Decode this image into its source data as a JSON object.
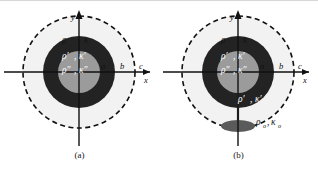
{
  "figure": {
    "type": "two-panel-schematic",
    "colors": {
      "background": "#ffffff",
      "outer_medium": "#ffffff",
      "mid_ring": "#eeeeee",
      "dark_shell": "#232323",
      "inner_core": "#9b9b9b",
      "ellipse": "#5a5a5a",
      "axis": "#111111",
      "dashed": "#111111",
      "top_rule": "#d8d8d8"
    },
    "panels": [
      {
        "id": "a",
        "caption": "(a)",
        "axes": {
          "x_label": "x",
          "y_label": "y"
        },
        "tick_labels": [
          "a",
          "b",
          "c"
        ],
        "regions": [
          {
            "name": "core",
            "label_rho": "ρ″",
            "label_kappa": "κ″",
            "fill": "#9b9b9b",
            "radius_label": "a"
          },
          {
            "name": "shell",
            "label_rho": "ρ′",
            "label_kappa": "κ′",
            "fill": "#232323",
            "radius_label": "b"
          },
          {
            "name": "outer",
            "label_rho": "ρ",
            "label_kappa": "κ",
            "fill": "#eeeeee",
            "radius_label": "c"
          }
        ],
        "dashed_circle": true,
        "has_ellipse": false
      },
      {
        "id": "b",
        "caption": "(b)",
        "axes": {
          "x_label": "x",
          "y_label": "y"
        },
        "tick_labels": [
          "a",
          "b",
          "c"
        ],
        "regions": [
          {
            "name": "core",
            "label_rho": "ρ″",
            "label_kappa": "κ″",
            "fill": "#9b9b9b",
            "radius_label": "a"
          },
          {
            "name": "shell",
            "label_rho": "ρ′",
            "label_kappa": "κ′",
            "fill": "#232323",
            "radius_label": "b"
          },
          {
            "name": "shell_lower",
            "label_rho": "ρ′",
            "label_kappa": "κ′",
            "fill": "#232323",
            "radius_label": "b"
          },
          {
            "name": "outer",
            "label_rho": "ρ",
            "label_kappa": "κ",
            "fill": "#eeeeee",
            "radius_label": "c"
          }
        ],
        "dashed_circle": true,
        "has_ellipse": true,
        "ellipse": {
          "label_rho": "ρ",
          "label_rho_sub": "o",
          "label_kappa": "κ",
          "label_kappa_sub": "o",
          "fill": "#5a5a5a"
        }
      }
    ]
  }
}
